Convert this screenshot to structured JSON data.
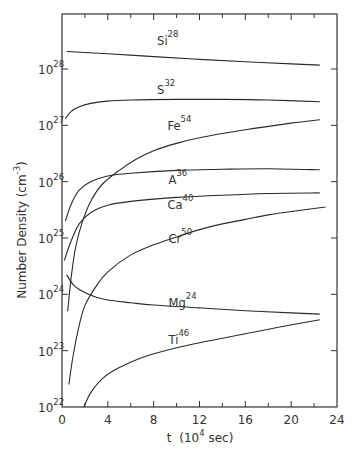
{
  "chart_data": {
    "type": "line",
    "title": "",
    "xlabel": "t (10^4 sec)",
    "ylabel": "Number Density (cm^-3)",
    "xlim": [
      0,
      24
    ],
    "ylim_log10": [
      22,
      29
    ],
    "yscale": "log",
    "grid": false,
    "legend": "inline labels",
    "x_ticks": [
      0,
      4,
      8,
      12,
      16,
      20,
      24
    ],
    "y_ticks": [
      "10^22",
      "10^23",
      "10^24",
      "10^25",
      "10^26",
      "10^27",
      "10^28"
    ],
    "series": [
      {
        "name": "Si28",
        "label": "Si",
        "mass": "28",
        "label_pos": [
          8.3,
          28.42
        ],
        "points": [
          [
            0.4,
            28.31
          ],
          [
            4,
            28.27
          ],
          [
            8,
            28.22
          ],
          [
            12,
            28.17
          ],
          [
            16,
            28.13
          ],
          [
            20,
            28.09
          ],
          [
            22.5,
            28.07
          ]
        ]
      },
      {
        "name": "S32",
        "label": "S",
        "mass": "32",
        "label_pos": [
          8.3,
          27.55
        ],
        "points": [
          [
            0.3,
            27.12
          ],
          [
            0.8,
            27.25
          ],
          [
            1.5,
            27.33
          ],
          [
            2.5,
            27.39
          ],
          [
            4,
            27.43
          ],
          [
            6,
            27.45
          ],
          [
            10,
            27.46
          ],
          [
            14,
            27.46
          ],
          [
            18,
            27.45
          ],
          [
            22.5,
            27.42
          ]
        ]
      },
      {
        "name": "Fe54",
        "label": "Fe",
        "mass": "54",
        "label_pos": [
          9.2,
          26.92
        ],
        "points": [
          [
            0.5,
            23.7
          ],
          [
            0.8,
            24.3
          ],
          [
            1.2,
            24.85
          ],
          [
            1.8,
            25.3
          ],
          [
            2.5,
            25.65
          ],
          [
            3.5,
            25.95
          ],
          [
            5,
            26.2
          ],
          [
            6.5,
            26.4
          ],
          [
            8,
            26.55
          ],
          [
            10,
            26.68
          ],
          [
            12,
            26.78
          ],
          [
            16,
            26.92
          ],
          [
            20,
            27.04
          ],
          [
            22.5,
            27.1
          ]
        ]
      },
      {
        "name": "A36",
        "label": "A",
        "mass": "36",
        "label_pos": [
          9.3,
          25.95
        ],
        "points": [
          [
            0.3,
            25.3
          ],
          [
            0.8,
            25.6
          ],
          [
            1.5,
            25.85
          ],
          [
            2.5,
            26.0
          ],
          [
            4,
            26.1
          ],
          [
            6,
            26.15
          ],
          [
            10,
            26.2
          ],
          [
            14,
            26.22
          ],
          [
            18,
            26.23
          ],
          [
            22.5,
            26.21
          ]
        ]
      },
      {
        "name": "Ca40",
        "label": "Ca",
        "mass": "40",
        "label_pos": [
          9.2,
          25.52
        ],
        "points": [
          [
            0.2,
            24.6
          ],
          [
            0.8,
            24.95
          ],
          [
            1.5,
            25.25
          ],
          [
            2.5,
            25.45
          ],
          [
            4,
            25.58
          ],
          [
            6,
            25.65
          ],
          [
            10,
            25.72
          ],
          [
            14,
            25.76
          ],
          [
            18,
            25.79
          ],
          [
            22.5,
            25.8
          ]
        ]
      },
      {
        "name": "Cr50",
        "label": "Cr",
        "mass": "50",
        "label_pos": [
          9.3,
          24.92
        ],
        "points": [
          [
            0.6,
            22.4
          ],
          [
            1,
            22.95
          ],
          [
            1.5,
            23.45
          ],
          [
            2,
            23.8
          ],
          [
            3,
            24.15
          ],
          [
            4,
            24.4
          ],
          [
            6,
            24.7
          ],
          [
            8,
            24.88
          ],
          [
            10,
            25.02
          ],
          [
            12,
            25.15
          ],
          [
            14,
            25.25
          ],
          [
            16,
            25.33
          ],
          [
            18,
            25.41
          ],
          [
            20,
            25.47
          ],
          [
            23,
            25.55
          ]
        ]
      },
      {
        "name": "Mg24",
        "label": "Mg",
        "mass": "24",
        "label_pos": [
          9.3,
          23.78
        ],
        "points": [
          [
            0.4,
            24.35
          ],
          [
            1,
            24.17
          ],
          [
            2,
            24.03
          ],
          [
            3,
            23.95
          ],
          [
            4,
            23.9
          ],
          [
            6,
            23.85
          ],
          [
            8,
            23.81
          ],
          [
            12,
            23.76
          ],
          [
            16,
            23.71
          ],
          [
            20,
            23.67
          ],
          [
            22.5,
            23.65
          ]
        ]
      },
      {
        "name": "Ti46",
        "label": "Ti",
        "mass": "46",
        "label_pos": [
          9.3,
          23.12
        ],
        "points": [
          [
            1.9,
            22.0
          ],
          [
            2.5,
            22.25
          ],
          [
            3.5,
            22.5
          ],
          [
            5,
            22.7
          ],
          [
            7,
            22.88
          ],
          [
            10,
            23.05
          ],
          [
            13,
            23.18
          ],
          [
            16,
            23.3
          ],
          [
            19,
            23.42
          ],
          [
            22.5,
            23.55
          ]
        ]
      }
    ]
  },
  "axes": {
    "x_title_main": "t",
    "x_title_unit": "(10",
    "x_title_exp": "4",
    "x_title_tail": " sec)",
    "y_title_main": "Number Density (cm",
    "y_title_exp": "-3",
    "y_title_tail": ")",
    "y_base": "10"
  }
}
